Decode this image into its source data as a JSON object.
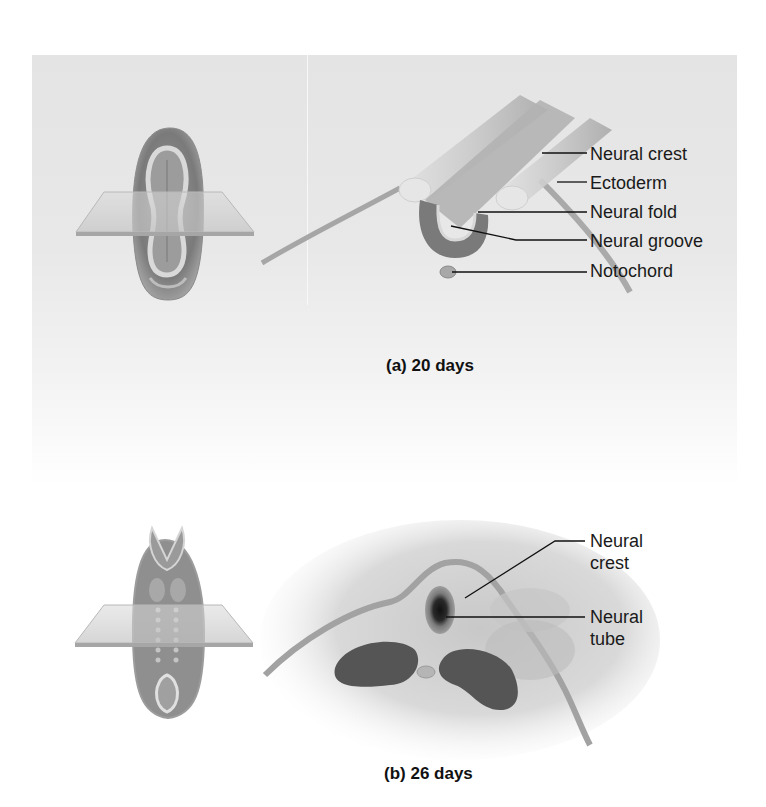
{
  "figure": {
    "panels": [
      {
        "id": "a",
        "caption": "(a) 20 days",
        "labels": [
          "Neural crest",
          "Ectoderm",
          "Neural fold",
          "Neural groove",
          "Notochord"
        ]
      },
      {
        "id": "b",
        "caption": "(b) 26 days",
        "labels": [
          "Neural crest",
          "Neural tube"
        ]
      }
    ]
  },
  "panel_a": {
    "caption": "(a) 20 days",
    "label_neural_crest": "Neural crest",
    "label_ectoderm": "Ectoderm",
    "label_neural_fold": "Neural fold",
    "label_neural_groove": "Neural groove",
    "label_notochord": "Notochord"
  },
  "panel_b": {
    "caption": "(b) 26 days",
    "label_neural_crest_line1": "Neural",
    "label_neural_crest_line2": "crest",
    "label_neural_tube_line1": "Neural",
    "label_neural_tube_line2": "tube"
  },
  "colors": {
    "background": "#ffffff",
    "panel_gray": "#e6e6e6",
    "tissue_dark": "#5a5a5a",
    "tissue_mid": "#8c8c8c",
    "tissue_light": "#d2d2d2",
    "text": "#1a1a1a"
  }
}
